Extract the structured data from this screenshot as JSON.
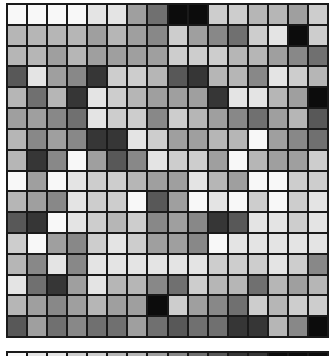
{
  "palette": {
    "W": "#f8f8f8",
    "VL": "#e4e4e4",
    "L": "#cdcdcd",
    "ML": "#b6b6b6",
    "M": "#9f9f9f",
    "MD": "#888888",
    "DM": "#707070",
    "D": "#585858",
    "VD": "#363636",
    "B": "#0c0c0c"
  },
  "grid": {
    "rows": 16,
    "cols": 16,
    "cells": [
      [
        "W",
        "W",
        "W",
        "W",
        "VL",
        "VL",
        "M",
        "DM",
        "B",
        "B",
        "L",
        "L",
        "ML",
        "ML",
        "M",
        "L"
      ],
      [
        "ML",
        "ML",
        "ML",
        "ML",
        "M",
        "ML",
        "M",
        "MD",
        "L",
        "M",
        "MD",
        "DM",
        "L",
        "VL",
        "B",
        "L"
      ],
      [
        "ML",
        "ML",
        "M",
        "ML",
        "M",
        "M",
        "M",
        "M",
        "L",
        "L",
        "L",
        "ML",
        "ML",
        "M",
        "MD",
        "DM"
      ],
      [
        "D",
        "VL",
        "M",
        "MD",
        "VD",
        "L",
        "L",
        "ML",
        "D",
        "VD",
        "ML",
        "ML",
        "MD",
        "VL",
        "L",
        "ML"
      ],
      [
        "ML",
        "DM",
        "ML",
        "VD",
        "VL",
        "L",
        "ML",
        "M",
        "M",
        "M",
        "VD",
        "VL",
        "VL",
        "ML",
        "M",
        "B"
      ],
      [
        "M",
        "M",
        "MD",
        "DM",
        "VL",
        "L",
        "L",
        "MD",
        "L",
        "ML",
        "M",
        "MD",
        "DM",
        "M",
        "ML",
        "D"
      ],
      [
        "ML",
        "MD",
        "M",
        "MD",
        "VD",
        "VD",
        "VL",
        "L",
        "M",
        "M",
        "ML",
        "ML",
        "W",
        "M",
        "MD",
        "DM"
      ],
      [
        "ML",
        "VD",
        "MD",
        "W",
        "M",
        "D",
        "MD",
        "VL",
        "L",
        "L",
        "M",
        "W",
        "ML",
        "M",
        "M",
        "L"
      ],
      [
        "W",
        "M",
        "W",
        "VL",
        "L",
        "L",
        "ML",
        "M",
        "M",
        "VL",
        "ML",
        "M",
        "W",
        "W",
        "L",
        "L"
      ],
      [
        "ML",
        "M",
        "MD",
        "VL",
        "L",
        "L",
        "W",
        "D",
        "M",
        "W",
        "VL",
        "W",
        "L",
        "W",
        "L",
        "VL"
      ],
      [
        "D",
        "VD",
        "W",
        "VL",
        "L",
        "ML",
        "L",
        "MD",
        "M",
        "MD",
        "VD",
        "D",
        "VL",
        "VL",
        "L",
        "VL"
      ],
      [
        "L",
        "W",
        "M",
        "MD",
        "L",
        "VL",
        "L",
        "M",
        "M",
        "MD",
        "W",
        "VL",
        "VL",
        "VL",
        "VL",
        "VL"
      ],
      [
        "ML",
        "MD",
        "VL",
        "MD",
        "VL",
        "VL",
        "VL",
        "VL",
        "VL",
        "VL",
        "L",
        "L",
        "L",
        "VL",
        "L",
        "MD"
      ],
      [
        "VL",
        "DM",
        "VD",
        "M",
        "VL",
        "ML",
        "ML",
        "MD",
        "DM",
        "L",
        "ML",
        "ML",
        "DM",
        "ML",
        "M",
        "ML"
      ],
      [
        "ML",
        "M",
        "MD",
        "M",
        "ML",
        "M",
        "M",
        "B",
        "L",
        "M",
        "MD",
        "DM",
        "L",
        "ML",
        "L",
        "L"
      ],
      [
        "D",
        "M",
        "DM",
        "MD",
        "DM",
        "DM",
        "M",
        "DM",
        "D",
        "DM",
        "DM",
        "VD",
        "VD",
        "ML",
        "MD",
        "B"
      ]
    ]
  },
  "bottom_strip": {
    "cells": [
      "W",
      "VL",
      "VL",
      "L",
      "L",
      "ML",
      "ML",
      "M",
      "MD",
      "DM",
      "D",
      "VD",
      "VD",
      "B",
      "B",
      "B"
    ]
  }
}
